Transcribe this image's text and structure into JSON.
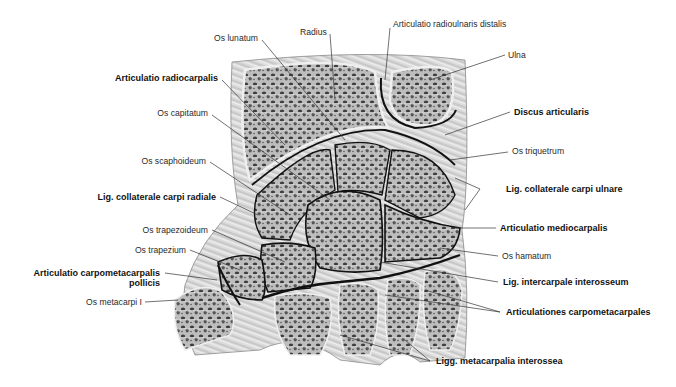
{
  "figure": {
    "colors": {
      "background": "#ffffff",
      "bone_fill": "#c9c9c9",
      "trabecula": "#4a4a4a",
      "cortex": "#e6e6e6",
      "joint_line": "#111111",
      "ligament": "#d8d8d8",
      "leader": "#333333"
    },
    "labels": {
      "os_lunatum": "Os lunatum",
      "radius": "Radius",
      "articulatio_radioulnaris_distalis": "Articulatio radioulnaris distalis",
      "ulna": "Ulna",
      "articulatio_radiocarpalis": "Articulatio radiocarpalis",
      "os_capitatum": "Os capitatum",
      "discus_articularis": "Discus articularis",
      "os_scaphoideum": "Os scaphoideum",
      "os_triquetrum": "Os triquetrum",
      "lig_collaterale_carpi_ulnare": "Lig. collaterale carpi ulnare",
      "lig_collaterale_carpi_radiale": "Lig. collaterale carpi radiale",
      "articulatio_mediocarpalis": "Articulatio mediocarpalis",
      "os_trapezoideum": "Os trapezoideum",
      "os_hamatum": "Os hamatum",
      "os_trapezium": "Os trapezium",
      "lig_intercarpale_interosseum": "Lig. intercarpale interosseum",
      "articulatio_carpometacarpalis_pollicis_1": "Articulatio carpometacarpalis",
      "articulatio_carpometacarpalis_pollicis_2": "pollicis",
      "articulationes_carpometacarpales": "Articulationes carpometacarpales",
      "os_metacarpi_i": "Os metacarpi I",
      "ligg_metacarpalia_interossea": "Ligg. metacarpalia interossea"
    }
  }
}
